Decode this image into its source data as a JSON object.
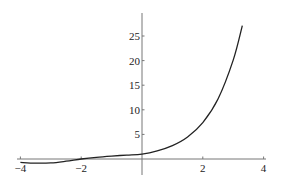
{
  "chart_data": {
    "type": "line",
    "title": "",
    "xlabel": "",
    "ylabel": "",
    "xlim": [
      -4,
      4
    ],
    "ylim": [
      -1,
      28
    ],
    "grid": false,
    "legend": null,
    "x_ticks": [
      -4,
      -2,
      2,
      4
    ],
    "x_tick_labels": [
      "-4",
      "-2",
      "2",
      "4"
    ],
    "y_ticks": [
      5,
      10,
      15,
      20,
      25
    ],
    "y_tick_labels": [
      "5",
      "10",
      "15",
      "20",
      "25"
    ],
    "series": [
      {
        "name": "f(x)",
        "color": "#222222",
        "x": [
          -4,
          -3.5,
          -3,
          -2.5,
          -2,
          -1.5,
          -1,
          -0.5,
          0,
          0.5,
          1,
          1.5,
          2,
          2.5,
          3,
          3.3
        ],
        "y": [
          -0.7,
          -0.85,
          -0.8,
          -0.45,
          0.0,
          0.35,
          0.6,
          0.8,
          1.0,
          1.65,
          2.72,
          4.48,
          7.39,
          12.18,
          20.09,
          27.1
        ]
      }
    ]
  },
  "style": {
    "axis_color": "#777777",
    "curve_color": "#222222",
    "background": "#ffffff"
  }
}
